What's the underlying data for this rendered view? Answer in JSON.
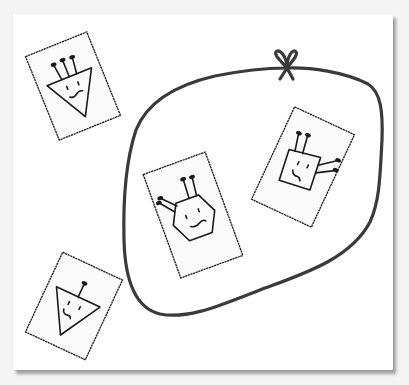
{
  "figure": {
    "colors": {
      "paper": "#ffffff",
      "background": "#f4f4f4",
      "card_fill": "#fafafa",
      "ink": "#1a1a1a",
      "loop": "#3a3a3a"
    },
    "loop": {
      "label": "Closed loop with bow",
      "contains_cards": [
        "hexagon-face",
        "diamond-face"
      ]
    },
    "cards": [
      {
        "id": "card-1",
        "shape": "triangle",
        "antennae": 3,
        "inside_loop": false,
        "mouth": "wavy"
      },
      {
        "id": "card-2",
        "shape": "triangle",
        "antennae": 1,
        "inside_loop": false,
        "mouth": "frown"
      },
      {
        "id": "card-3",
        "shape": "hexagon",
        "antennae": 4,
        "inside_loop": true,
        "mouth": "wavy"
      },
      {
        "id": "card-4",
        "shape": "diamond",
        "antennae": 4,
        "inside_loop": true,
        "mouth": "frown"
      }
    ]
  }
}
